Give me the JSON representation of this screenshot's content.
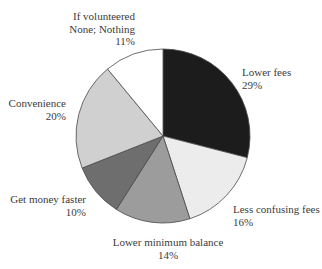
{
  "chart_data": {
    "type": "pie",
    "title": "",
    "start_angle_deg": 0,
    "direction": "clockwise",
    "slices": [
      {
        "label": "Lower fees",
        "value": 29,
        "value_label": "29%",
        "color": "#1c1c1c"
      },
      {
        "label": "Less confusing fees",
        "value": 16,
        "value_label": "16%",
        "color": "#ececec"
      },
      {
        "label": "Lower minimum balance",
        "value": 14,
        "value_label": "14%",
        "color": "#9c9c9c"
      },
      {
        "label": "Get money faster",
        "value": 10,
        "value_label": "10%",
        "color": "#6e6e6e"
      },
      {
        "label": "Convenience",
        "value": 20,
        "value_label": "20%",
        "color": "#d0d0d0"
      },
      {
        "label": "If volunteered None; Nothing",
        "value": 11,
        "value_label": "11%",
        "color": "#ffffff"
      }
    ],
    "categories": [
      "Lower fees",
      "Less confusing fees",
      "Lower minimum balance",
      "Get money faster",
      "Convenience",
      "If volunteered None; Nothing"
    ],
    "values": [
      29,
      16,
      14,
      10,
      20,
      11
    ],
    "legend": "none (direct labels)"
  },
  "labels": {
    "lower_fees": {
      "line1": "Lower fees",
      "pct": "29%"
    },
    "less_confusing": {
      "line1": "Less confusing fees",
      "pct": "16%"
    },
    "lower_min": {
      "line1": "Lower minimum balance",
      "pct": "14%"
    },
    "faster": {
      "line1": "Get money faster",
      "pct": "10%"
    },
    "convenience": {
      "line1": "Convenience",
      "pct": "20%"
    },
    "none": {
      "line1": "If volunteered",
      "line2": "None; Nothing",
      "pct": "11%"
    }
  }
}
